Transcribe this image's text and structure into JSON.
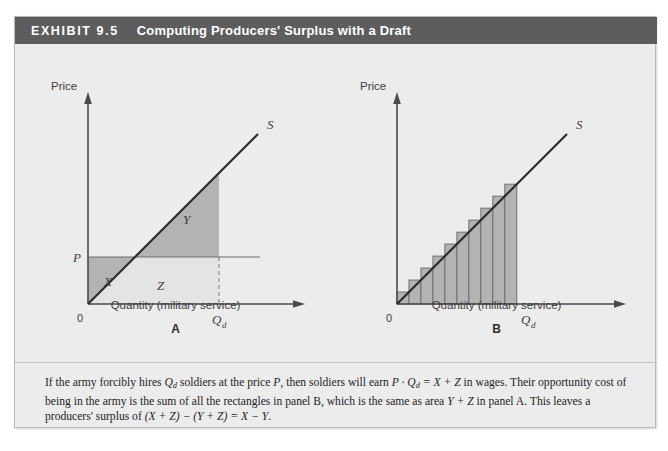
{
  "exhibit": {
    "number_label": "EXHIBIT 9.5",
    "title": "Computing Producers' Surplus with a Draft"
  },
  "panel_a": {
    "letter": "A",
    "y_axis_label": "Price",
    "x_axis_label": "Quantity (military service)",
    "origin_label": "0",
    "price_label": "P",
    "quantity_label": "Q",
    "quantity_sub": "d",
    "supply_label": "S",
    "regions": [
      {
        "name": "X",
        "label": "X",
        "fill": "#b3b3b3",
        "description": "dark triangle below price line, left of supply curve"
      },
      {
        "name": "Y",
        "label": "Y",
        "fill": "#b3b3b3",
        "description": "dark triangle above price line under supply curve"
      },
      {
        "name": "Z",
        "label": "Z",
        "fill": "#e4e4e4",
        "description": "light rectangle below price line right of supply curve"
      }
    ]
  },
  "panel_b": {
    "letter": "B",
    "y_axis_label": "Price",
    "x_axis_label": "Quantity (military service)",
    "origin_label": "0",
    "quantity_label": "Q",
    "quantity_sub": "d",
    "supply_label": "S"
  },
  "caption": {
    "line1_a": "If the army forcibly hires ",
    "line1_q": "Q",
    "line1_qsub": "d",
    "line1_b": " soldiers at the price ",
    "line1_p": "P",
    "line1_c": ", then soldiers will earn ",
    "line1_pq": "P · Q",
    "line1_pqsub": "d",
    "line1_eq": " = X + Z",
    "line1_d": " in wages. Their opportunity cost of being in the army is the sum of all the rectangles in panel B, which is the same as area ",
    "line1_yz": "Y + Z",
    "line1_e": " in panel A. This leaves a producers' surplus of ",
    "line1_f": "(X + Z) − (Y + Z) = X − Y",
    "line1_g": "."
  },
  "chart_data": [
    {
      "type": "area",
      "panel": "A",
      "title": "Computing Producers' Surplus with a Draft — Panel A",
      "xlabel": "Quantity (military service)",
      "ylabel": "Price",
      "xlim": [
        0,
        1
      ],
      "ylim": [
        0,
        1
      ],
      "grid": false,
      "legend": "none",
      "series": [
        {
          "name": "S",
          "type": "line",
          "annotation": "S",
          "x": [
            0.0,
            0.88
          ],
          "y": [
            0.0,
            0.88
          ]
        },
        {
          "name": "Price line P",
          "type": "hline",
          "y_value": 0.225,
          "label": "P",
          "x_extent": [
            0.0,
            1.0
          ]
        },
        {
          "name": "Quantity line Qd",
          "type": "vline",
          "x_value": 0.62,
          "label": "Qd",
          "style": "dashed",
          "y_extent": [
            0.0,
            0.225
          ]
        }
      ],
      "annotations": [
        {
          "text": "X",
          "x": 0.11,
          "y": 0.105,
          "meaning": "producer surplus area below P left of S"
        },
        {
          "text": "Y",
          "x": 0.45,
          "y": 0.37,
          "meaning": "area above P under S up to Qd"
        },
        {
          "text": "Z",
          "x": 0.37,
          "y": 0.085,
          "meaning": "area below P right of S up to Qd"
        },
        {
          "text": "S",
          "x": 0.92,
          "y": 0.93,
          "meaning": "supply curve label"
        }
      ]
    },
    {
      "type": "bar",
      "panel": "B",
      "title": "Computing Producers' Surplus with a Draft — Panel B",
      "xlabel": "Quantity (military service)",
      "ylabel": "Price",
      "xlim": [
        0,
        1
      ],
      "ylim": [
        0,
        1
      ],
      "grid": false,
      "legend": "none",
      "bar_count": 10,
      "categories": [
        "1",
        "2",
        "3",
        "4",
        "5",
        "6",
        "7",
        "8",
        "9",
        "10"
      ],
      "values": [
        0.062,
        0.124,
        0.186,
        0.248,
        0.31,
        0.372,
        0.434,
        0.496,
        0.558,
        0.62
      ],
      "bar_fill": "#b3b3b3",
      "bar_stroke": "#6f6f6f",
      "series": [
        {
          "name": "S",
          "type": "line",
          "annotation": "S",
          "x": [
            0.0,
            0.88
          ],
          "y": [
            0.0,
            0.88
          ]
        }
      ],
      "annotations": [
        {
          "text": "Qd",
          "x": 0.62,
          "y": 0.0,
          "meaning": "draft quantity tick on x-axis"
        },
        {
          "text": "S",
          "x": 0.92,
          "y": 0.93,
          "meaning": "supply curve label"
        }
      ]
    }
  ],
  "colors": {
    "header_bar": "#5d5d5d",
    "panel_background": "#ececed",
    "region_dark": "#b3b3b3",
    "region_light": "#e4e4e4",
    "axis": "#4a4a4a",
    "text": "#2d2d2d"
  }
}
